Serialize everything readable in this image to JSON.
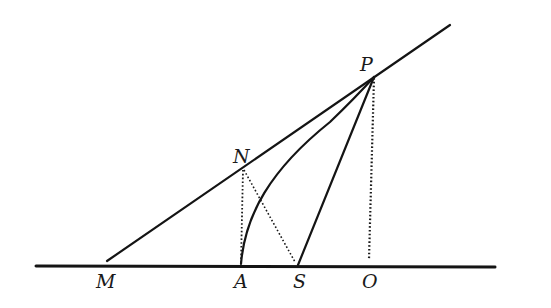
{
  "diagram": {
    "type": "geometric-construction",
    "points": {
      "M": {
        "label": "M",
        "x": 107,
        "y": 264
      },
      "A": {
        "label": "A",
        "x": 241,
        "y": 265
      },
      "S": {
        "label": "S",
        "x": 298,
        "y": 265
      },
      "O": {
        "label": "O",
        "x": 369,
        "y": 265
      },
      "N": {
        "label": "N",
        "x": 243,
        "y": 169
      },
      "P": {
        "label": "P",
        "x": 374,
        "y": 76
      }
    },
    "labels": {
      "P": "P",
      "N": "N",
      "M": "M",
      "A": "A",
      "S": "S",
      "O": "O"
    },
    "segments": [
      {
        "from": "axis-left",
        "to": "axis-right",
        "style": "solid",
        "name": "axis-line"
      },
      {
        "from": "M",
        "to": "tangent-end",
        "style": "solid",
        "name": "tangent-line-MP"
      },
      {
        "from": "S",
        "to": "P",
        "style": "solid",
        "name": "focal-radius-SP"
      },
      {
        "from": "A",
        "to": "P",
        "style": "solid-curve",
        "name": "parabola-arc-AP"
      },
      {
        "from": "N",
        "to": "A",
        "style": "dotted",
        "name": "perpendicular-NA"
      },
      {
        "from": "N",
        "to": "S",
        "style": "dotted",
        "name": "segment-NS"
      },
      {
        "from": "P",
        "to": "O",
        "style": "dotted",
        "name": "perpendicular-PO"
      }
    ],
    "colors": {
      "ink": "#141414",
      "background": "#ffffff"
    }
  }
}
